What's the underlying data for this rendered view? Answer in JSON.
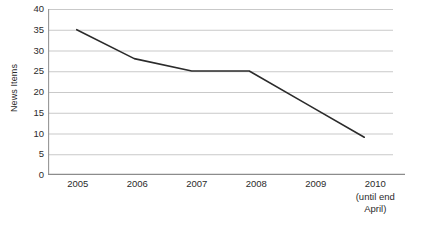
{
  "chart_data": {
    "type": "line",
    "title": "",
    "xlabel": "",
    "ylabel": "News Items",
    "categories": [
      "2005",
      "2006",
      "2007",
      "2008",
      "2009",
      "2010"
    ],
    "category_notes": [
      "",
      "",
      "",
      "",
      "",
      "(until end\nApril)"
    ],
    "values": [
      35,
      28,
      25,
      25,
      17,
      9
    ],
    "series": [
      {
        "name": "News Items",
        "values": [
          35,
          28,
          25,
          25,
          17,
          9
        ]
      }
    ],
    "ylim": [
      0,
      40
    ],
    "ytick_labels": [
      "40",
      "35",
      "30",
      "25",
      "20",
      "15",
      "10",
      "5",
      "0"
    ],
    "ytick_values": [
      40,
      35,
      30,
      25,
      20,
      15,
      10,
      5,
      0
    ],
    "grid": true,
    "grid_axis": "y",
    "legend": false,
    "legend_position": "none",
    "markers": false,
    "colors": {
      "line": "#2b2b2b",
      "grid": "#c9c9c9",
      "axis": "#808080",
      "text": "#2b2b2b",
      "background": "#ffffff"
    }
  },
  "x_labels": {
    "y2005": "2005",
    "y2006": "2006",
    "y2007": "2007",
    "y2008": "2008",
    "y2009": "2009",
    "y2010": "2010",
    "y2010_note_line1": "(until end",
    "y2010_note_line2": "April)"
  },
  "y_labels": {
    "t40": "40",
    "t35": "35",
    "t30": "30",
    "t25": "25",
    "t20": "20",
    "t15": "15",
    "t10": "10",
    "t5": "5",
    "t0": "0"
  },
  "axis": {
    "y_title": "News Items"
  }
}
